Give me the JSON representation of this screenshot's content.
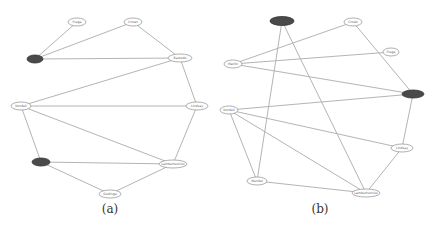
{
  "figure": {
    "panels": [
      {
        "id": "a",
        "caption": "(a)",
        "caption_pos": [
          110,
          213
        ],
        "nodes": [
          {
            "id": "a1",
            "label": "Fraga",
            "x": 77,
            "y": 22,
            "rx": 9,
            "ry": 4,
            "highlighted": false
          },
          {
            "id": "a2",
            "label": "Crown",
            "x": 133,
            "y": 22,
            "rx": 9,
            "ry": 4,
            "highlighted": false
          },
          {
            "id": "a3",
            "label": "",
            "x": 35,
            "y": 59,
            "rx": 8,
            "ry": 4,
            "highlighted": true
          },
          {
            "id": "a4",
            "label": "Bastedo",
            "x": 180,
            "y": 58,
            "rx": 12,
            "ry": 4,
            "highlighted": false
          },
          {
            "id": "a5",
            "label": "Nordell",
            "x": 21,
            "y": 106,
            "rx": 10,
            "ry": 4,
            "highlighted": false
          },
          {
            "id": "a6",
            "label": "Lindsay",
            "x": 197,
            "y": 106,
            "rx": 11,
            "ry": 4,
            "highlighted": false
          },
          {
            "id": "a7",
            "label": "",
            "x": 41,
            "y": 162,
            "rx": 9,
            "ry": 4,
            "highlighted": true
          },
          {
            "id": "a8",
            "label": "Lambertsonius",
            "x": 173,
            "y": 164,
            "rx": 14,
            "ry": 4,
            "highlighted": false
          },
          {
            "id": "a9",
            "label": "Godinga",
            "x": 110,
            "y": 194,
            "rx": 11,
            "ry": 4,
            "highlighted": false
          }
        ],
        "edges": [
          [
            "a1",
            "a3"
          ],
          [
            "a2",
            "a3"
          ],
          [
            "a3",
            "a4"
          ],
          [
            "a2",
            "a4"
          ],
          [
            "a4",
            "a5"
          ],
          [
            "a4",
            "a6"
          ],
          [
            "a5",
            "a6"
          ],
          [
            "a5",
            "a7"
          ],
          [
            "a5",
            "a8"
          ],
          [
            "a6",
            "a8"
          ],
          [
            "a7",
            "a8"
          ],
          [
            "a7",
            "a9"
          ],
          [
            "a8",
            "a9"
          ]
        ]
      },
      {
        "id": "b",
        "caption": "(b)",
        "caption_pos": [
          320,
          213
        ],
        "nodes": [
          {
            "id": "b1",
            "label": "",
            "x": 282,
            "y": 21,
            "rx": 12,
            "ry": 4.5,
            "highlighted": true
          },
          {
            "id": "b2",
            "label": "Crown",
            "x": 353,
            "y": 22,
            "rx": 9,
            "ry": 4,
            "highlighted": false
          },
          {
            "id": "b3",
            "label": "Fraga",
            "x": 391,
            "y": 52,
            "rx": 8,
            "ry": 4,
            "highlighted": false
          },
          {
            "id": "b4",
            "label": "Martin",
            "x": 233,
            "y": 64,
            "rx": 9,
            "ry": 4,
            "highlighted": false
          },
          {
            "id": "b5",
            "label": "",
            "x": 413,
            "y": 94,
            "rx": 11,
            "ry": 4,
            "highlighted": true
          },
          {
            "id": "b6",
            "label": "Nordell",
            "x": 229,
            "y": 110,
            "rx": 9,
            "ry": 4,
            "highlighted": false
          },
          {
            "id": "b7",
            "label": "Lindsay",
            "x": 402,
            "y": 148,
            "rx": 11,
            "ry": 4,
            "highlighted": false
          },
          {
            "id": "b8",
            "label": "Mendel",
            "x": 257,
            "y": 181,
            "rx": 10,
            "ry": 4,
            "highlighted": false
          },
          {
            "id": "b9",
            "label": "Lambertsonius",
            "x": 366,
            "y": 193,
            "rx": 14,
            "ry": 4,
            "highlighted": false
          }
        ],
        "edges": [
          [
            "b1",
            "b8"
          ],
          [
            "b1",
            "b9"
          ],
          [
            "b4",
            "b2"
          ],
          [
            "b4",
            "b3"
          ],
          [
            "b4",
            "b5"
          ],
          [
            "b2",
            "b5"
          ],
          [
            "b6",
            "b5"
          ],
          [
            "b5",
            "b7"
          ],
          [
            "b6",
            "b7"
          ],
          [
            "b6",
            "b8"
          ],
          [
            "b6",
            "b9"
          ],
          [
            "b8",
            "b9"
          ],
          [
            "b7",
            "b9"
          ]
        ]
      }
    ]
  },
  "colors": {
    "edge": "#b4b4b4",
    "node_fill": "#ffffff",
    "node_stroke": "#9a9a9a",
    "highlight_fill": "#4a4a4a"
  }
}
